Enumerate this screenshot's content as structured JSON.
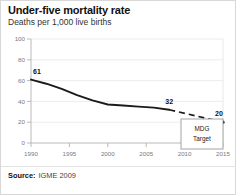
{
  "header": {
    "title": "Under-five mortality rate",
    "subtitle": "Deaths per 1,000 live births"
  },
  "footer": {
    "source_label": "Source:",
    "source_value": "IGME 2009"
  },
  "annotations": {
    "mdg_line1": "MDG",
    "mdg_line2": "Target"
  },
  "chart_data": {
    "type": "line",
    "title": "Under-five mortality rate",
    "subtitle": "Deaths per 1,000 live births",
    "xlabel": "",
    "ylabel": "Deaths per 1,000 live births",
    "xlim": [
      1990,
      2015
    ],
    "ylim": [
      0,
      100
    ],
    "xticks": [
      1990,
      1995,
      2000,
      2005,
      2010,
      2015
    ],
    "yticks": [
      0,
      20,
      40,
      60,
      80,
      100
    ],
    "grid": true,
    "legend": "none",
    "series": [
      {
        "name": "Observed under-five mortality rate",
        "style": "solid",
        "x": [
          1990,
          1992,
          1994,
          1996,
          1998,
          2000,
          2002,
          2004,
          2006,
          2008
        ],
        "values": [
          61,
          57,
          52,
          46,
          41,
          37,
          36,
          35,
          34,
          32
        ]
      },
      {
        "name": "Projection to MDG target",
        "style": "dashed",
        "x": [
          2008,
          2015
        ],
        "values": [
          32,
          20
        ]
      }
    ],
    "point_labels": [
      {
        "x": 1990,
        "value": 61,
        "text": "61"
      },
      {
        "x": 2008,
        "value": 32,
        "text": "32"
      },
      {
        "x": 2015,
        "value": 20,
        "text": "20"
      }
    ],
    "ytick_labels": [
      "0",
      "20",
      "40",
      "60",
      "80",
      "100"
    ],
    "xtick_labels": [
      "1990",
      "1995",
      "2000",
      "2005",
      "2010",
      "2015"
    ]
  }
}
